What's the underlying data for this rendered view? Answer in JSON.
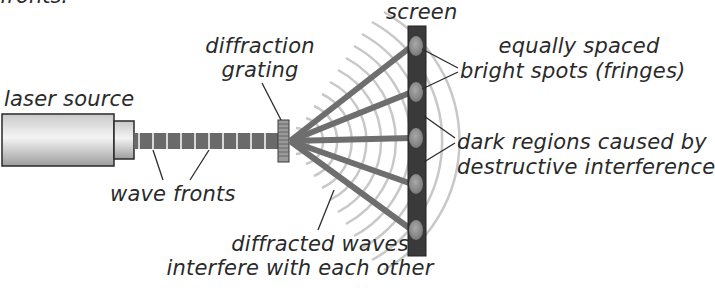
{
  "diagram": {
    "title_fragment": "fronts.",
    "labels": {
      "laser_source": "laser source",
      "wave_fronts": "wave fronts",
      "diffraction_grating_line1": "diffraction",
      "diffraction_grating_line2": "grating",
      "screen": "screen",
      "bright_spots_line1": "equally spaced",
      "bright_spots_line2": "bright spots (fringes)",
      "dark_regions_line1": "dark regions caused by",
      "dark_regions_line2": "destructive interference",
      "diffracted_waves_line1": "diffracted waves",
      "diffracted_waves_line2": "interfere with each other"
    },
    "colors": {
      "ray": "#6e6e6e",
      "screen": "#3a3a3a",
      "fringe": "#8a8a8a",
      "wavefront_arc": "#c8c8c8",
      "beam": "#6a6a6a",
      "text": "#2a2a2a"
    },
    "fringe_count": 5
  }
}
